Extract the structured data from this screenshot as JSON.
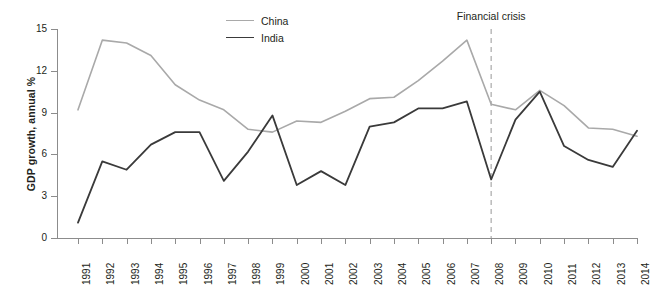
{
  "chart_data": {
    "type": "line",
    "title": "",
    "xlabel": "",
    "ylabel": "GDP growth, annual %",
    "xlim": [
      1991,
      2014
    ],
    "ylim": [
      0,
      15
    ],
    "yticks": [
      0,
      3,
      6,
      9,
      12,
      15
    ],
    "grid": false,
    "legend_position": "top-center",
    "categories": [
      "1991",
      "1992",
      "1993",
      "1994",
      "1995",
      "1996",
      "1997",
      "1998",
      "1999",
      "2000",
      "2001",
      "2002",
      "2003",
      "2004",
      "2005",
      "2006",
      "2007",
      "2008",
      "2009",
      "2010",
      "2011",
      "2012",
      "2013",
      "2014"
    ],
    "series": [
      {
        "name": "China",
        "color": "#a9a9a9",
        "values": [
          9.2,
          14.2,
          14.0,
          13.1,
          11.0,
          9.9,
          9.2,
          7.8,
          7.6,
          8.4,
          8.3,
          9.1,
          10.0,
          10.1,
          11.3,
          12.7,
          14.2,
          9.6,
          9.2,
          10.6,
          9.5,
          7.9,
          7.8,
          7.3
        ]
      },
      {
        "name": "India",
        "color": "#3a3a3a",
        "values": [
          1.1,
          5.5,
          4.9,
          6.7,
          7.6,
          7.6,
          4.1,
          6.2,
          8.8,
          3.8,
          4.8,
          3.8,
          8.0,
          8.3,
          9.3,
          9.3,
          9.8,
          4.2,
          8.5,
          10.5,
          6.6,
          5.6,
          5.1,
          7.7
        ]
      }
    ],
    "annotations": [
      {
        "text": "Financial crisis",
        "x": "2008",
        "style": "dashed-vertical-line",
        "color": "#b5b5b5"
      }
    ]
  },
  "legend": {
    "items": [
      {
        "label": "China",
        "color": "#a9a9a9",
        "width": "1.6px"
      },
      {
        "label": "India",
        "color": "#3a3a3a",
        "width": "1.8px"
      }
    ]
  },
  "axes": {
    "y_title": "GDP growth, annual %",
    "y_tick_labels": [
      "0",
      "3",
      "6",
      "9",
      "12",
      "15"
    ],
    "x_tick_labels": [
      "1991",
      "1992",
      "1993",
      "1994",
      "1995",
      "1996",
      "1997",
      "1998",
      "1999",
      "2000",
      "2001",
      "2002",
      "2003",
      "2004",
      "2005",
      "2006",
      "2007",
      "2008",
      "2009",
      "2010",
      "2011",
      "2012",
      "2013",
      "2014"
    ]
  },
  "annotation": {
    "crisis_label": "Financial crisis"
  },
  "colors": {
    "china": "#a9a9a9",
    "india": "#3a3a3a",
    "axis": "#8c8c8c",
    "dashed": "#b5b5b5",
    "text": "#231f20",
    "background": "#ffffff"
  }
}
